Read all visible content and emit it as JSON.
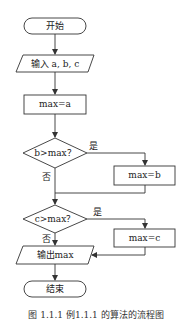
{
  "flowchart": {
    "nodes": {
      "start": {
        "type": "terminal",
        "label": "开始"
      },
      "input": {
        "type": "io",
        "label": "输入 a, b, c"
      },
      "init": {
        "type": "process",
        "label": "max=a"
      },
      "cond1": {
        "type": "decision",
        "label": "b>max？"
      },
      "assign_b": {
        "type": "process",
        "label": "max=b"
      },
      "cond2": {
        "type": "decision",
        "label": "c>max？"
      },
      "assign_c": {
        "type": "process",
        "label": "max=c"
      },
      "output": {
        "type": "io",
        "label": "输出max"
      },
      "end": {
        "type": "terminal",
        "label": "结束"
      }
    },
    "edges": {
      "cond1_yes": "是",
      "cond1_no": "否",
      "cond2_yes": "是",
      "cond2_no": "否"
    },
    "caption": "图 1.1.1  例1.1.1 的算法的流程图"
  },
  "colors": {
    "stroke": "#333333",
    "background": "#ffffff"
  }
}
